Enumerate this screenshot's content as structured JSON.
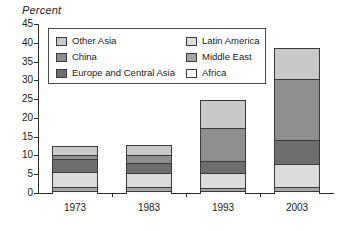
{
  "chart_data": {
    "type": "bar",
    "subtype": "stacked-bar",
    "title": "",
    "ylabel": "Percent",
    "xlabel": "",
    "ylim": [
      0,
      45
    ],
    "ytick_step": 5,
    "yticks": [
      0,
      5,
      10,
      15,
      20,
      25,
      30,
      35,
      40,
      45
    ],
    "ytick_labels": [
      "0",
      "5",
      "10",
      "15",
      "20",
      "25",
      "30",
      "35",
      "40",
      "45"
    ],
    "grid": false,
    "legend_position": "upper-left-inside",
    "categories": [
      "1973",
      "1983",
      "1993",
      "2003"
    ],
    "series": [
      {
        "name": "Africa",
        "values": [
          0.6,
          0.5,
          0.5,
          0.5
        ],
        "color": "#fbfbfb"
      },
      {
        "name": "Middle East",
        "values": [
          1.0,
          1.0,
          0.8,
          1.0
        ],
        "color": "#a5a5a5"
      },
      {
        "name": "Latin America",
        "values": [
          4.1,
          3.9,
          3.9,
          6.1
        ],
        "color": "#dcdcdc"
      },
      {
        "name": "Europe and Central Asia",
        "values": [
          3.3,
          2.6,
          3.3,
          6.4
        ],
        "color": "#6e6e6e"
      },
      {
        "name": "China",
        "values": [
          1.1,
          2.1,
          8.8,
          16.3
        ],
        "color": "#8f8f8f"
      },
      {
        "name": "Other Asia",
        "values": [
          2.3,
          2.6,
          7.4,
          8.4
        ],
        "color": "#c9c9c9"
      }
    ],
    "totals": [
      12.4,
      12.7,
      24.7,
      38.7
    ]
  },
  "legend": {
    "entries": [
      {
        "label": "Other Asia",
        "swatch": "legend-swatch-other-asia"
      },
      {
        "label": "Latin America",
        "swatch": "legend-swatch-latin-america"
      },
      {
        "label": "China",
        "swatch": "legend-swatch-china"
      },
      {
        "label": "Middle East",
        "swatch": "legend-swatch-middle-east"
      },
      {
        "label": "Europe and Central Asia",
        "swatch": "legend-swatch-europe-central-asia"
      },
      {
        "label": "Africa",
        "swatch": "legend-swatch-africa"
      }
    ]
  }
}
